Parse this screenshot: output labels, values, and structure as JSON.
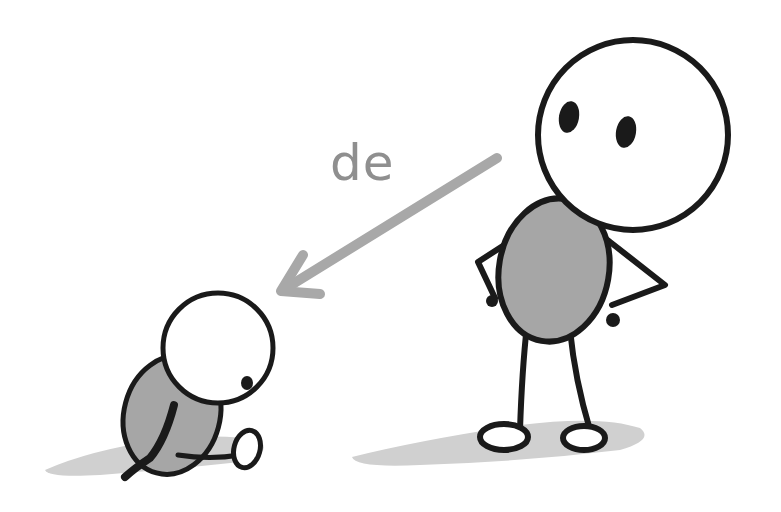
{
  "illustration": {
    "label": "de",
    "colors": {
      "outline": "#1a1a1a",
      "body_fill": "#a6a6a6",
      "shadow": "#d0d0d0",
      "arrow": "#a8a8a8",
      "label": "#8f8f8f",
      "background": "#ffffff"
    },
    "figures": [
      {
        "name": "adult-figure",
        "pose": "standing, hands on hips, looking down"
      },
      {
        "name": "child-figure",
        "pose": "sitting on ground, legs stretched"
      }
    ],
    "arrow": {
      "from": "adult-figure",
      "to": "child-figure",
      "direction": "down-left"
    }
  }
}
